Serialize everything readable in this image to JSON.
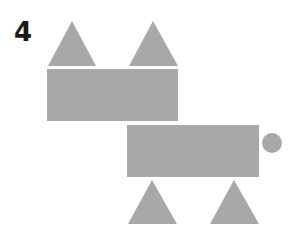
{
  "puzzle": {
    "number": "4",
    "fill_color": "#a8a8a8",
    "shapes": [
      {
        "type": "triangle",
        "name": "top-left-triangle",
        "points": "72,21 48,66 96,66"
      },
      {
        "type": "triangle",
        "name": "top-right-triangle",
        "points": "153,21 129,66 178,66"
      },
      {
        "type": "rectangle",
        "name": "upper-rectangle",
        "x": 47,
        "y": 69,
        "width": 131,
        "height": 52
      },
      {
        "type": "rectangle",
        "name": "lower-rectangle",
        "x": 127,
        "y": 125,
        "width": 132,
        "height": 52
      },
      {
        "type": "circle",
        "name": "circle",
        "cx": 272,
        "cy": 143,
        "r": 10
      },
      {
        "type": "triangle",
        "name": "bottom-left-triangle",
        "points": "152,180 128,224 177,224"
      },
      {
        "type": "triangle",
        "name": "bottom-right-triangle",
        "points": "234,180 210,224 259,224"
      }
    ]
  }
}
